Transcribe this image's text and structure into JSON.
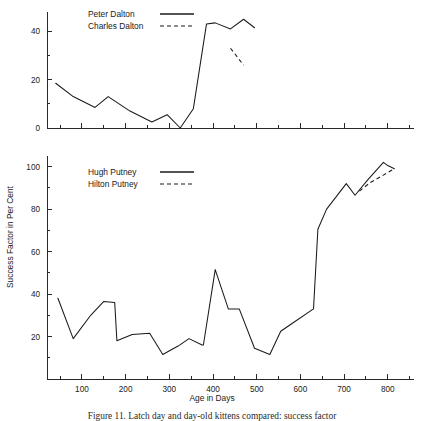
{
  "figure": {
    "y_axis_title": "Success Factor in Per Cent",
    "x_axis_title": "Age in Days",
    "caption": "Figure 11. Latch day and day-old kittens compared: success factor"
  },
  "chart_data": [
    {
      "type": "line",
      "panel": "top",
      "title": "",
      "xlabel": "",
      "ylabel": "Success Factor in Per Cent",
      "xlim": [
        20,
        860
      ],
      "ylim": [
        0,
        48
      ],
      "xticks": [
        100,
        200,
        300,
        400,
        500,
        600,
        700,
        800
      ],
      "xticklabels": [
        "",
        "",
        "",
        "",
        "",
        "",
        "",
        ""
      ],
      "yticks": [
        0,
        20,
        40
      ],
      "yticklabels": [
        "0",
        "20",
        "40"
      ],
      "minor_xtick_step": 50,
      "minor_ytick_step": 10,
      "grid": false,
      "legend_position": "top-center",
      "series": [
        {
          "name": "Peter Dalton",
          "style": "solid",
          "x": [
            40,
            80,
            130,
            160,
            210,
            260,
            295,
            325,
            355,
            385,
            405,
            440,
            470,
            495
          ],
          "y": [
            18.5,
            13.0,
            8.5,
            13.0,
            7.0,
            2.5,
            5.5,
            0.0,
            8.0,
            43.0,
            43.5,
            41.0,
            45.0,
            41.5
          ]
        },
        {
          "name": "Charles Dalton",
          "style": "dashed",
          "x": [
            440,
            470
          ],
          "y": [
            33.0,
            26.0
          ]
        }
      ]
    },
    {
      "type": "line",
      "panel": "bottom",
      "title": "",
      "xlabel": "Age in Days",
      "ylabel": "Success Factor in Per Cent",
      "xlim": [
        20,
        860
      ],
      "ylim": [
        0,
        105
      ],
      "xticks": [
        100,
        200,
        300,
        400,
        500,
        600,
        700,
        800
      ],
      "xticklabels": [
        "100",
        "200",
        "300",
        "400",
        "500",
        "600",
        "700",
        "800"
      ],
      "yticks": [
        20,
        40,
        60,
        80,
        100
      ],
      "yticklabels": [
        "20",
        "40",
        "60",
        "80",
        "100"
      ],
      "minor_xtick_step": 50,
      "minor_ytick_step": 10,
      "grid": false,
      "legend_position": "top-left",
      "series": [
        {
          "name": "Hugh Putney",
          "style": "solid",
          "x": [
            45,
            80,
            120,
            150,
            175,
            180,
            215,
            255,
            285,
            320,
            345,
            375,
            378,
            405,
            435,
            460,
            495,
            530,
            555,
            580,
            630,
            640,
            660,
            705,
            725,
            755,
            790,
            800,
            815
          ],
          "y": [
            38.0,
            19.0,
            30.0,
            36.5,
            36.0,
            18.0,
            21.0,
            21.5,
            11.5,
            15.5,
            19.0,
            16.0,
            16.0,
            51.5,
            33.0,
            33.0,
            14.5,
            11.5,
            22.5,
            26.0,
            33.0,
            70.5,
            80.0,
            92.0,
            86.5,
            94.0,
            102.0,
            100.5,
            99.0
          ]
        },
        {
          "name": "Hilton Putney",
          "style": "dashed",
          "x": [
            735,
            760,
            790,
            815
          ],
          "y": [
            88.5,
            92.5,
            96.0,
            99.0
          ]
        }
      ]
    }
  ],
  "legends": {
    "top": [
      {
        "label": "Peter Dalton",
        "style": "solid"
      },
      {
        "label": "Charles Dalton",
        "style": "dashed"
      }
    ],
    "bottom": [
      {
        "label": "Hugh Putney",
        "style": "solid"
      },
      {
        "label": "Hilton Putney",
        "style": "dashed"
      }
    ]
  }
}
